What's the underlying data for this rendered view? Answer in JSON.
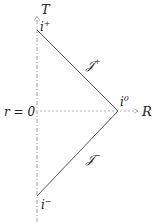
{
  "diagram": {
    "labels": {
      "time_axis": "T",
      "radial_axis": "R",
      "origin": "r = 0",
      "future_timelike_infinity": "i",
      "future_timelike_sup": "+",
      "past_timelike_infinity": "i",
      "past_timelike_sup": "−",
      "spatial_infinity": "i",
      "spatial_sup": "0",
      "future_null_infinity": "𝒥",
      "future_null_sup": "+",
      "past_null_infinity": "𝒥",
      "past_null_sup": "−"
    },
    "colors": {
      "lines": "#555555",
      "dashed_axes": "#999999",
      "text": "#222222"
    }
  }
}
